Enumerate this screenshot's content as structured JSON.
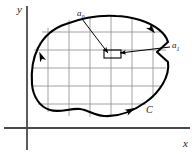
{
  "figure": {
    "background_color": "#ffffff",
    "width": 194,
    "height": 154
  },
  "axes": {
    "color": "#4a4a4a",
    "x_axis": {
      "label": "x",
      "label_x": 183,
      "label_y": 147,
      "line": {
        "x1": 4,
        "y1": 128,
        "x2": 190,
        "y2": 128
      }
    },
    "y_axis": {
      "label": "y",
      "label_x": 17,
      "label_y": 13,
      "line": {
        "x1": 27,
        "y1": 6,
        "x2": 27,
        "y2": 150
      }
    }
  },
  "contour": {
    "name": "C",
    "label": "C",
    "label_x": 146,
    "label_y": 113,
    "stroke_color": "#000000",
    "stroke_width": 2.1,
    "orientation": "clockwise",
    "path": "M 140 20 C 156 25 166 34 168 42 L 157 52 L 168 62 C 170 76 160 92 146 102 C 132 112 118 117 104 116 C 94 115 88 110 80 109 C 70 108 60 113 50 110 C 40 107 33 97 32 84 C 31 70 33 58 38 48 C 44 36 54 28 66 24 C 82 18 100 15 116 16 C 125 16 133 18 140 20 Z"
  },
  "grid": {
    "color": "#8c8c8c",
    "stroke_width": 0.8,
    "vertical_lines": [
      {
        "x": 48,
        "y1": 28,
        "y2": 112
      },
      {
        "x": 69,
        "y1": 20,
        "y2": 116
      },
      {
        "x": 90,
        "y1": 17,
        "y2": 117
      },
      {
        "x": 111,
        "y1": 16,
        "y2": 115
      },
      {
        "x": 132,
        "y1": 18,
        "y2": 110
      },
      {
        "x": 153,
        "y1": 26,
        "y2": 98
      }
    ],
    "horizontal_lines": [
      {
        "y": 32,
        "x1": 42,
        "x2": 160
      },
      {
        "y": 50,
        "x1": 34,
        "x2": 166
      },
      {
        "y": 68,
        "x1": 32,
        "x2": 166
      },
      {
        "y": 86,
        "x1": 32,
        "x2": 161
      },
      {
        "y": 104,
        "x1": 38,
        "x2": 146
      }
    ]
  },
  "markers": {
    "a0": {
      "label": "a",
      "subscript": "0",
      "label_x": 77,
      "label_y": 16,
      "leader_line": {
        "x1": 82,
        "y1": 19,
        "x2": 108,
        "y2": 53
      },
      "arrow_tip": {
        "x": 108,
        "y": 53
      }
    },
    "a1": {
      "label": "a",
      "subscript": "1",
      "label_x": 172,
      "label_y": 48,
      "leader_line": {
        "x1": 170,
        "y1": 47,
        "x2": 120,
        "y2": 53
      },
      "arrow_tip": {
        "x": 120,
        "y": 53
      }
    },
    "inner_cell": {
      "description": "small highlighted subdivision cell near a0",
      "x": 104,
      "y": 50,
      "width": 17,
      "height": 8
    }
  },
  "direction_arrows": [
    {
      "name": "contour-arrow-upper-right",
      "x": 152,
      "y": 30,
      "angle": 48
    },
    {
      "name": "contour-arrow-left",
      "x": 41,
      "y": 56,
      "angle": 248
    },
    {
      "name": "contour-arrow-bottom-right",
      "x": 131,
      "y": 110,
      "angle": 332
    }
  ]
}
